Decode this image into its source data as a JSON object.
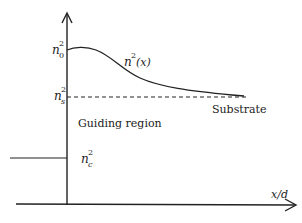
{
  "diagram": {
    "type": "refractive-index-profile",
    "axes": {
      "x_label": "x/d",
      "y_label": ""
    },
    "labels": {
      "n0_base": "n",
      "n0_sup": "2",
      "n0_sub": "0",
      "curve_base": "n",
      "curve_sup": "2",
      "curve_arg": " (x)",
      "ns_base": "n",
      "ns_sup": "2",
      "ns_sub": "s",
      "nc_base": "n",
      "nc_sup": "2",
      "nc_sub": "c",
      "substrate": "Substrate",
      "guiding_region": "Guiding region"
    },
    "colors": {
      "line": "#222222",
      "background": "#ffffff"
    }
  }
}
